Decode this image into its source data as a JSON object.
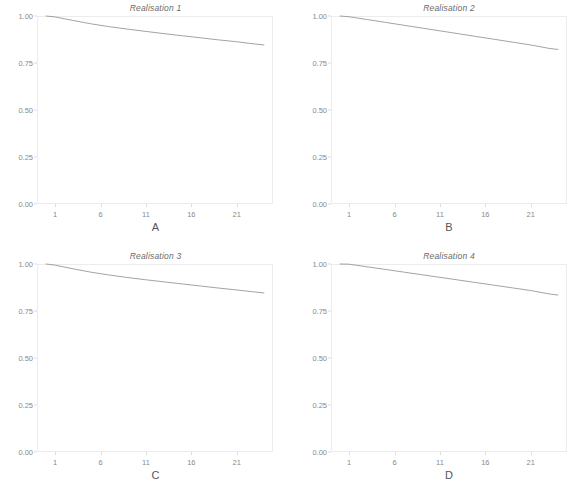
{
  "figure": {
    "layout": "2x2 small multiples",
    "panel_letters": [
      "A",
      "B",
      "C",
      "D"
    ]
  },
  "chart_data": [
    {
      "type": "line",
      "title": "Realisation 1",
      "panel_label": "A",
      "xlabel": "",
      "ylabel": "",
      "xlim": [
        -1,
        25
      ],
      "ylim": [
        0.0,
        1.0
      ],
      "xticks": [
        1,
        6,
        11,
        16,
        21
      ],
      "xtick_labels": [
        "1",
        "6",
        "11",
        "16",
        "21"
      ],
      "yticks": [
        0.0,
        0.25,
        0.5,
        0.75,
        1.0
      ],
      "ytick_labels": [
        "0.00",
        "0.25",
        "0.50",
        "0.75",
        "1.00"
      ],
      "grid": false,
      "legend": "none",
      "line_color": "#8c8c8c",
      "x": [
        0,
        1,
        3,
        5,
        7,
        9,
        11,
        13,
        15,
        17,
        19,
        21,
        23,
        24
      ],
      "y": [
        1.0,
        0.995,
        0.976,
        0.958,
        0.943,
        0.93,
        0.918,
        0.906,
        0.895,
        0.884,
        0.873,
        0.863,
        0.851,
        0.846
      ]
    },
    {
      "type": "line",
      "title": "Realisation 2",
      "panel_label": "B",
      "xlabel": "",
      "ylabel": "",
      "xlim": [
        -1,
        25
      ],
      "ylim": [
        0.0,
        1.0
      ],
      "xticks": [
        1,
        6,
        11,
        16,
        21
      ],
      "xtick_labels": [
        "1",
        "6",
        "11",
        "16",
        "21"
      ],
      "yticks": [
        0.0,
        0.25,
        0.5,
        0.75,
        1.0
      ],
      "ytick_labels": [
        "0.00",
        "0.25",
        "0.50",
        "0.75",
        "1.00"
      ],
      "grid": false,
      "legend": "none",
      "line_color": "#8c8c8c",
      "x": [
        0,
        1,
        3,
        5,
        7,
        9,
        11,
        13,
        15,
        17,
        19,
        21,
        23,
        24
      ],
      "y": [
        1.0,
        0.996,
        0.981,
        0.966,
        0.951,
        0.936,
        0.921,
        0.906,
        0.891,
        0.876,
        0.861,
        0.846,
        0.828,
        0.822
      ]
    },
    {
      "type": "line",
      "title": "Realisation 3",
      "panel_label": "C",
      "xlabel": "",
      "ylabel": "",
      "xlim": [
        -1,
        25
      ],
      "ylim": [
        0.0,
        1.0
      ],
      "xticks": [
        1,
        6,
        11,
        16,
        21
      ],
      "xtick_labels": [
        "1",
        "6",
        "11",
        "16",
        "21"
      ],
      "yticks": [
        0.0,
        0.25,
        0.5,
        0.75,
        1.0
      ],
      "ytick_labels": [
        "0.00",
        "0.25",
        "0.50",
        "0.75",
        "1.00"
      ],
      "grid": false,
      "legend": "none",
      "line_color": "#8c8c8c",
      "x": [
        0,
        1,
        3,
        5,
        7,
        9,
        11,
        13,
        15,
        17,
        19,
        21,
        23,
        24
      ],
      "y": [
        1.0,
        0.994,
        0.974,
        0.956,
        0.941,
        0.928,
        0.916,
        0.905,
        0.894,
        0.883,
        0.872,
        0.862,
        0.851,
        0.846
      ]
    },
    {
      "type": "line",
      "title": "Realisation 4",
      "panel_label": "D",
      "xlabel": "",
      "ylabel": "",
      "xlim": [
        -1,
        25
      ],
      "ylim": [
        0.0,
        1.0
      ],
      "xticks": [
        1,
        6,
        11,
        16,
        21
      ],
      "xtick_labels": [
        "1",
        "6",
        "11",
        "16",
        "21"
      ],
      "yticks": [
        0.0,
        0.25,
        0.5,
        0.75,
        1.0
      ],
      "ytick_labels": [
        "0.00",
        "0.25",
        "0.50",
        "0.75",
        "1.00"
      ],
      "grid": false,
      "legend": "none",
      "line_color": "#8c8c8c",
      "x": [
        0,
        1,
        3,
        5,
        7,
        9,
        11,
        13,
        15,
        17,
        19,
        21,
        23,
        24
      ],
      "y": [
        1.0,
        0.999,
        0.985,
        0.971,
        0.957,
        0.943,
        0.929,
        0.915,
        0.901,
        0.887,
        0.873,
        0.859,
        0.841,
        0.835
      ]
    }
  ]
}
